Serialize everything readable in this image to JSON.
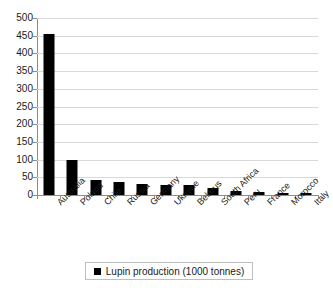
{
  "chart_data": {
    "type": "bar",
    "title": "",
    "subtitle": "",
    "xlabel": "",
    "ylabel": "",
    "ylim": [
      0,
      500
    ],
    "ytick_step": 50,
    "yticks": [
      0,
      50,
      100,
      150,
      200,
      250,
      300,
      350,
      400,
      450,
      500
    ],
    "grid": true,
    "legend_position": "bottom",
    "series_color": "#000000",
    "gridline_color": "#d9d9d9",
    "axis_color": "#8c8c8c",
    "categories": [
      "Australia",
      "Poland",
      "Chile",
      "Russia",
      "Germany",
      "Ukraine",
      "Belarus",
      "South Africa",
      "Peru",
      "France",
      "Morocco",
      "Italy"
    ],
    "series": [
      {
        "name": "Lupin production (1000 tonnes)",
        "values": [
          455,
          100,
          42,
          38,
          31,
          29,
          28,
          19,
          10,
          8,
          5,
          5
        ]
      }
    ],
    "legend": [
      "Lupin production (1000 tonnes)"
    ]
  },
  "legend": {
    "label": "Lupin production (1000 tonnes)",
    "swatch": "legend-swatch-black"
  }
}
